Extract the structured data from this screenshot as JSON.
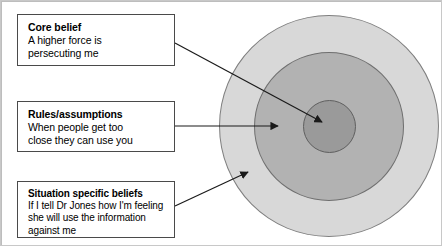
{
  "diagram": {
    "type": "concentric-circles",
    "circles": [
      {
        "name": "outer-ring",
        "fill": "#d8d8d8",
        "stroke": "#7f7f7f",
        "linked_box": "situation-specific-beliefs"
      },
      {
        "name": "middle-ring",
        "fill": "#b2b2b2",
        "stroke": "#6f6f6f",
        "linked_box": "rules-assumptions"
      },
      {
        "name": "inner-circle",
        "fill": "#9a9a9a",
        "stroke": "#5f5f5f",
        "linked_box": "core-belief"
      }
    ],
    "boxes": [
      {
        "id": "core-belief",
        "title": "Core belief",
        "body_lines": [
          "A higher force is",
          "persecuting me"
        ]
      },
      {
        "id": "rules-assumptions",
        "title": "Rules/assumptions",
        "body_lines": [
          "When people get too",
          "close they can use you"
        ]
      },
      {
        "id": "situation-specific-beliefs",
        "title": "Situation specific beliefs",
        "body_lines": [
          "If I tell Dr Jones how I'm feeling",
          "she will use the information",
          "against me"
        ]
      }
    ],
    "arrows": [
      {
        "name": "arrow-core-belief",
        "from": [
          174,
          42
        ],
        "to": [
          321,
          121
        ]
      },
      {
        "name": "arrow-rules",
        "from": [
          174,
          125
        ],
        "to": [
          277,
          125
        ]
      },
      {
        "name": "arrow-situation",
        "from": [
          174,
          205
        ],
        "to": [
          247,
          171
        ]
      }
    ],
    "colors": {
      "background": "#ffffff",
      "box_border": "#4a4a4a",
      "text": "#000000",
      "arrow": "#1a1a1a"
    }
  }
}
